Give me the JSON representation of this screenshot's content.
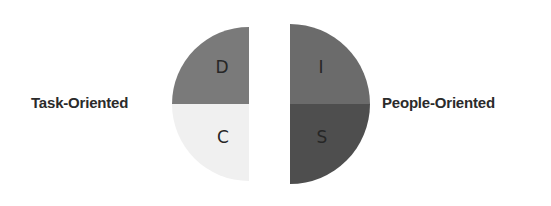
{
  "labels": {
    "left": "Task-Oriented",
    "right": "People-Oriented"
  },
  "quadrants": [
    {
      "id": "D",
      "letter": "D",
      "position": "top-left",
      "color": "#7a7a7a"
    },
    {
      "id": "I",
      "letter": "I",
      "position": "top-right",
      "color": "#6b6b6b"
    },
    {
      "id": "S",
      "letter": "S",
      "position": "bottom-right",
      "color": "#4e4e4e"
    },
    {
      "id": "C",
      "letter": "C",
      "position": "bottom-left",
      "color": "#f0f0f0"
    }
  ]
}
